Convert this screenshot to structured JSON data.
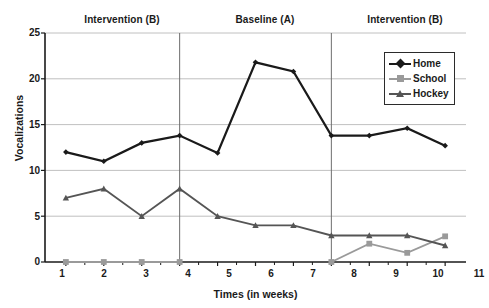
{
  "chart_data": {
    "type": "line",
    "title": "",
    "xlabel": "Times (in weeks)",
    "ylabel": "Vocalizations",
    "x": [
      1,
      2,
      3,
      4,
      5,
      6,
      7,
      8,
      9,
      10,
      11
    ],
    "xtick_labels": [
      "1",
      "2",
      "3",
      "4",
      "5",
      "6",
      "7",
      "8",
      "9",
      "10",
      "11"
    ],
    "ytick_labels": [
      "0",
      "5",
      "10",
      "15",
      "20",
      "25"
    ],
    "yticks": [
      0,
      5,
      10,
      15,
      20,
      25
    ],
    "xlim": [
      0.45,
      11.55
    ],
    "ylim": [
      0,
      25
    ],
    "grid": "horizontal",
    "legend_position": "top-right",
    "series": [
      {
        "name": "Home",
        "color": "#1a1a1a",
        "marker": "diamond",
        "values": [
          12.0,
          11.0,
          13.0,
          13.8,
          11.9,
          21.8,
          20.8,
          13.8,
          13.8,
          14.6,
          12.7
        ]
      },
      {
        "name": "School",
        "color": "#9a9a9a",
        "marker": "square",
        "values": [
          0.0,
          0.0,
          0.0,
          0.0,
          null,
          null,
          null,
          0.0,
          2.0,
          1.0,
          2.8
        ]
      },
      {
        "name": "Hockey",
        "color": "#555555",
        "marker": "triangle",
        "values": [
          7.0,
          8.0,
          5.0,
          8.0,
          5.0,
          4.0,
          4.0,
          2.9,
          2.9,
          2.9,
          1.8
        ]
      }
    ],
    "phases": [
      {
        "label": "Intervention (B)",
        "start": 1,
        "end": 4
      },
      {
        "label": "Baseline (A)",
        "start": 4,
        "end": 8
      },
      {
        "label": "Intervention (B)",
        "start": 8,
        "end": 11
      }
    ],
    "phase_dividers": [
      4,
      8
    ],
    "annotations": []
  }
}
